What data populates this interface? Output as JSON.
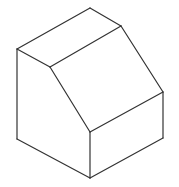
{
  "figure": {
    "type": "isometric-solid",
    "stroke_color": "#333333",
    "background": "#ffffff",
    "vertices": {
      "A": [
        17,
        49
      ],
      "B": [
        90,
        8
      ],
      "C": [
        121,
        26
      ],
      "D": [
        50,
        67
      ],
      "E": [
        163,
        92
      ],
      "F": [
        90,
        132
      ],
      "G": [
        17,
        139
      ],
      "H": [
        90,
        178
      ],
      "I": [
        163,
        138
      ]
    },
    "faces": [
      {
        "name": "top-face",
        "points": [
          "A",
          "B",
          "C",
          "D"
        ]
      },
      {
        "name": "sloped-face",
        "points": [
          "D",
          "C",
          "E",
          "F"
        ]
      },
      {
        "name": "left-face",
        "points": [
          "A",
          "D",
          "F",
          "H",
          "G"
        ]
      },
      {
        "name": "front-right-face",
        "points": [
          "F",
          "E",
          "I",
          "H"
        ]
      }
    ],
    "edges": [
      [
        "A",
        "B"
      ],
      [
        "B",
        "C"
      ],
      [
        "C",
        "D"
      ],
      [
        "D",
        "A"
      ],
      [
        "C",
        "E"
      ],
      [
        "E",
        "F"
      ],
      [
        "F",
        "D"
      ],
      [
        "A",
        "G"
      ],
      [
        "G",
        "H"
      ],
      [
        "H",
        "F"
      ],
      [
        "E",
        "I"
      ],
      [
        "I",
        "H"
      ]
    ]
  }
}
